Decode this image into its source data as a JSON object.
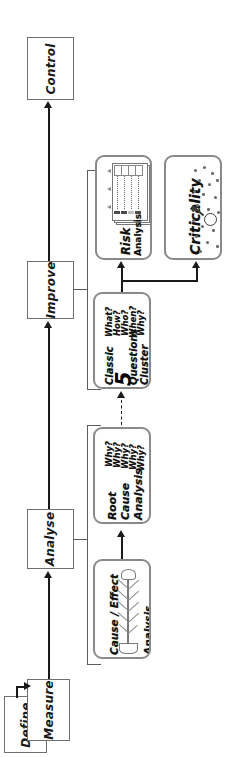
{
  "diagram": {
    "orientation": "rotated-90-ccw",
    "colors": {
      "box_border": "#6f6f6f",
      "tool_border": "#8a8a8a",
      "connector": "#1a1a1a",
      "bracket": "#5d5d5d",
      "background": "#ffffff"
    }
  },
  "phases": [
    {
      "id": "control",
      "label": "Control"
    },
    {
      "id": "improve",
      "label": "Improve"
    },
    {
      "id": "analyse",
      "label": "Analyse"
    },
    {
      "id": "measure",
      "label": "Measure"
    },
    {
      "id": "define",
      "label": "Define"
    }
  ],
  "tools": {
    "risk_analysis": {
      "line1": "Risk",
      "line2": "Analysis",
      "icon": "spreadsheet-matrix-icon"
    },
    "criticality": {
      "label": "Criticality",
      "icon": "scatter-magnifier-icon"
    },
    "classic_questions": {
      "line1": "Classic",
      "number": "5",
      "line2": "Questions",
      "line3": "Cluster",
      "questions": [
        "What?",
        "How?",
        "Who?",
        "When?",
        "Why?"
      ]
    },
    "root_cause": {
      "line1": "Root",
      "line2": "Cause",
      "line3": "Analysis",
      "questions": [
        "Why?",
        "Why?",
        "Why?",
        "Why?",
        "Why?"
      ]
    },
    "cause_effect": {
      "line1": "Cause / Effect",
      "line2": "Analysis",
      "icon": "fishbone-diagram-icon"
    }
  }
}
